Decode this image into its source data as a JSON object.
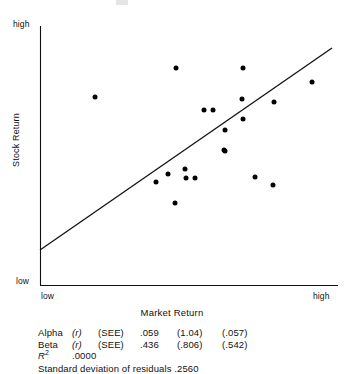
{
  "figure": {
    "y_axis": {
      "title": "Stock Return",
      "high_label": "high",
      "low_label": "low"
    },
    "x_axis": {
      "title": "Market Return",
      "low_label": "low",
      "high_label": "high"
    }
  },
  "stats": {
    "alpha": {
      "name": "Alpha",
      "r": "(r)",
      "see": "(SEE)",
      "value": ".059",
      "se1": "(1.04)",
      "se2": "(.057)"
    },
    "beta": {
      "name": "Beta",
      "r": "(r)",
      "see": "(SEE)",
      "value": ".436",
      "se1": "(.806)",
      "se2": "(.542)"
    },
    "r_squared": {
      "label": "R",
      "exponent": "2",
      "value": ".0000"
    },
    "residuals": {
      "text": "Standard deviation of residuals .2560"
    }
  },
  "chart_data": {
    "type": "scatter",
    "title": "",
    "xlabel": "Market Return",
    "ylabel": "Stock Return",
    "xlim": [
      0,
      1
    ],
    "ylim": [
      0,
      1
    ],
    "xtick_labels": [
      "low",
      "high"
    ],
    "ytick_labels": [
      "low",
      "high"
    ],
    "grid": false,
    "legend": null,
    "marker": {
      "shape": "circle",
      "filled": true,
      "color": "#000000",
      "size_px": 5
    },
    "points": [
      {
        "px": 95,
        "py": 97,
        "x": 0.185,
        "y": 0.725
      },
      {
        "px": 176,
        "py": 68,
        "x": 0.457,
        "y": 0.838
      },
      {
        "px": 243,
        "py": 68,
        "x": 0.682,
        "y": 0.838
      },
      {
        "px": 312,
        "py": 82,
        "x": 0.913,
        "y": 0.784
      },
      {
        "px": 242,
        "py": 99,
        "x": 0.678,
        "y": 0.718
      },
      {
        "px": 274,
        "py": 102,
        "x": 0.786,
        "y": 0.707
      },
      {
        "px": 204,
        "py": 110,
        "x": 0.55,
        "y": 0.676
      },
      {
        "px": 213,
        "py": 110,
        "x": 0.581,
        "y": 0.676
      },
      {
        "px": 243,
        "py": 119,
        "x": 0.682,
        "y": 0.641
      },
      {
        "px": 225,
        "py": 130,
        "x": 0.621,
        "y": 0.598
      },
      {
        "px": 224,
        "py": 150,
        "x": 0.617,
        "y": 0.521
      },
      {
        "px": 225,
        "py": 151,
        "x": 0.621,
        "y": 0.517
      },
      {
        "px": 156,
        "py": 182,
        "x": 0.389,
        "y": 0.398
      },
      {
        "px": 168,
        "py": 174,
        "x": 0.43,
        "y": 0.429
      },
      {
        "px": 185,
        "py": 169,
        "x": 0.487,
        "y": 0.448
      },
      {
        "px": 186,
        "py": 178,
        "x": 0.49,
        "y": 0.413
      },
      {
        "px": 195,
        "py": 178,
        "x": 0.52,
        "y": 0.413
      },
      {
        "px": 255,
        "py": 177,
        "x": 0.722,
        "y": 0.417
      },
      {
        "px": 273,
        "py": 185,
        "x": 0.782,
        "y": 0.386
      },
      {
        "px": 175,
        "py": 203,
        "x": 0.453,
        "y": 0.317
      }
    ],
    "regression_line": {
      "px_start": [
        40,
        250
      ],
      "px_end": [
        332,
        48
      ],
      "x_start": 0.0,
      "y_start": 0.135,
      "x_end": 0.98,
      "y_end": 0.915
    },
    "annotations": {
      "alpha": 0.059,
      "alpha_r": 1.04,
      "alpha_see": 0.057,
      "beta": 0.436,
      "beta_r": 0.806,
      "beta_see": 0.542,
      "r_squared": 0.0,
      "sd_residuals": 0.256
    }
  }
}
